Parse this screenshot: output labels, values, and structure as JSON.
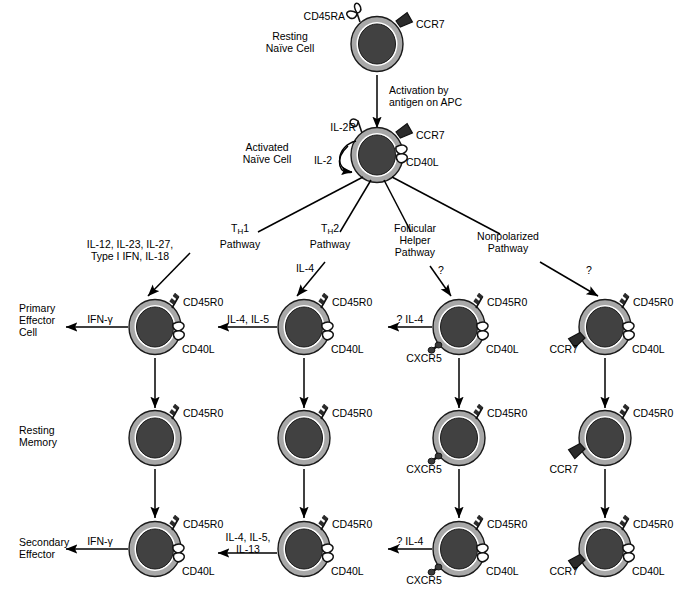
{
  "figure": {
    "type": "diagram"
  },
  "stage_labels": {
    "resting_naive": "Resting\nNaïve Cell",
    "resting_naive_line1": "Resting",
    "resting_naive_line2": "Naïve Cell",
    "activated_naive_line1": "Activated",
    "activated_naive_line2": "Naïve Cell",
    "primary_effector_line1": "Primary",
    "primary_effector_line2": "Effector",
    "primary_effector_line3": "Cell",
    "resting_memory_line1": "Resting",
    "resting_memory_line2": "Memory",
    "secondary_effector_line1": "Secondary",
    "secondary_effector_line2": "Effector"
  },
  "activation": {
    "line1": "Activation by",
    "line2": "antigen on APC"
  },
  "naive_cell_markers": {
    "cd45ra": "CD45RA",
    "ccr7": "CCR7"
  },
  "activated_cell_markers": {
    "il2r": "IL-2R",
    "il2": "IL-2",
    "ccr7": "CCR7",
    "cd40l": "CD40L"
  },
  "pathways": [
    {
      "id": "th1",
      "name_line1": "T<sub>H</sub>1",
      "name_plain": "TH1",
      "name_line2": "Pathway",
      "inducing_cytokines_line1": "IL-12, IL-23, IL-27,",
      "inducing_cytokines_line2": "Type I IFN, IL-18",
      "question_mark": "",
      "effector_output": "IFN-γ",
      "secondary_output_line1": "IFN-γ",
      "secondary_output_line2": "",
      "markers": {
        "top": "CD45R0",
        "right": "CD40L",
        "left": ""
      }
    },
    {
      "id": "th2",
      "name_line1": "T<sub>H</sub>2",
      "name_plain": "TH2",
      "name_line2": "Pathway",
      "inducing_cytokines_line1": "IL-4",
      "inducing_cytokines_line2": "",
      "question_mark": "",
      "effector_output": "IL-4, IL-5",
      "secondary_output_line1": "IL-4, IL-5,",
      "secondary_output_line2": "IL-13",
      "markers": {
        "top": "CD45R0",
        "right": "CD40L",
        "left": ""
      }
    },
    {
      "id": "follicular-helper",
      "name_line1": "Follicular",
      "name_line1b": "Helper",
      "name_plain": "Follicular Helper",
      "name_line2": "Pathway",
      "inducing_cytokines_line1": "",
      "inducing_cytokines_line2": "",
      "question_mark": "?",
      "effector_output": "? IL-4",
      "secondary_output_line1": "? IL-4",
      "secondary_output_line2": "",
      "markers": {
        "top": "CD45R0",
        "right": "CD40L",
        "left": "CXCR5"
      }
    },
    {
      "id": "nonpolarized",
      "name_line1": "Nonpolarized",
      "name_plain": "Nonpolarized",
      "name_line2": "Pathway",
      "inducing_cytokines_line1": "",
      "inducing_cytokines_line2": "",
      "question_mark": "?",
      "effector_output": "",
      "secondary_output_line1": "",
      "secondary_output_line2": "",
      "markers": {
        "top": "CD45R0",
        "right": "CD40L",
        "left": "CCR7"
      }
    }
  ],
  "memory_row_markers": [
    {
      "top": "CD45R0",
      "left": "",
      "right": ""
    },
    {
      "top": "CD45R0",
      "left": "",
      "right": ""
    },
    {
      "top": "CD45R0",
      "left": "CXCR5",
      "right": ""
    },
    {
      "top": "CD45R0",
      "left": "CCR7",
      "right": ""
    }
  ],
  "secondary_row_markers": [
    {
      "top": "CD45R0",
      "left": "",
      "right": "CD40L"
    },
    {
      "top": "CD45R0",
      "left": "",
      "right": "CD40L"
    },
    {
      "top": "CD45R0",
      "left": "CXCR5",
      "right": "CD40L"
    },
    {
      "top": "CD45R0",
      "left": "CCR7",
      "right": "CD40L"
    }
  ],
  "colors": {
    "membrane": "#a8a8a8",
    "membrane_stroke": "#1a1a1a",
    "inner_white": "#ffffff",
    "nucleus": "#414141",
    "line": "#000000",
    "ccr7_fill": "#2b2b2b",
    "text": "#000000"
  }
}
